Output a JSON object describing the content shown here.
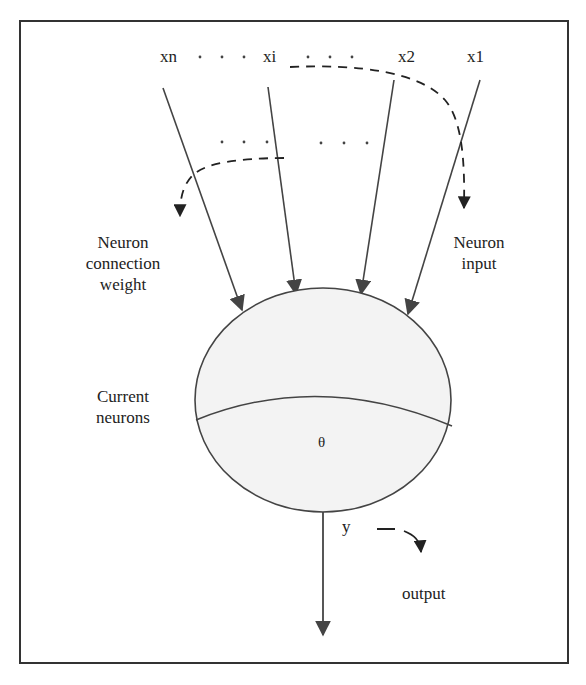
{
  "diagram": {
    "inputs": [
      {
        "id": "xn",
        "label": "xn"
      },
      {
        "id": "xi",
        "label": "xi"
      },
      {
        "id": "x2",
        "label": "x2"
      },
      {
        "id": "x1",
        "label": "x1"
      }
    ],
    "input_ellipsis": ". . .",
    "weight_ellipsis": ". . .",
    "labels": {
      "weight": [
        "Neuron",
        "connection",
        "weight"
      ],
      "input": [
        "Neuron",
        "input"
      ],
      "neuron": [
        "Current",
        "neurons"
      ],
      "threshold": "θ",
      "output_var": "y",
      "output": "output"
    },
    "colors": {
      "line": "#444444",
      "frame": "#333333",
      "neuron_fill": "#f3f3f3",
      "text": "#222222"
    }
  }
}
